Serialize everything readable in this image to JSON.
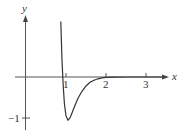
{
  "chart_data": {
    "type": "line",
    "title": "",
    "xlabel": "x",
    "ylabel": "y",
    "x_ticks": [
      {
        "value": 1,
        "label": "1"
      },
      {
        "value": 2,
        "label": "2"
      },
      {
        "value": 3,
        "label": "3"
      }
    ],
    "y_ticks": [
      {
        "value": -1,
        "label": "−1"
      }
    ],
    "xlim": [
      -0.25,
      3.55
    ],
    "ylim": [
      -1.15,
      1.5
    ],
    "grid": false,
    "legend": null,
    "series": [
      {
        "name": "f(x)",
        "x": [
          0.87,
          0.9,
          0.93,
          0.96,
          1.0,
          1.05,
          1.1,
          1.15,
          1.2,
          1.3,
          1.4,
          1.5,
          1.6,
          1.7,
          1.8,
          1.9,
          2.0,
          2.2,
          2.5,
          3.0,
          3.4
        ],
        "y": [
          1.35,
          0.4,
          -0.2,
          -0.65,
          -0.95,
          -1.05,
          -1.0,
          -0.88,
          -0.75,
          -0.52,
          -0.35,
          -0.22,
          -0.13,
          -0.08,
          -0.045,
          -0.02,
          -0.01,
          -0.003,
          0.0,
          0.0,
          0.0
        ]
      }
    ]
  },
  "colors": {
    "axis": "#555555",
    "curve": "#333333",
    "text": "#333333"
  }
}
